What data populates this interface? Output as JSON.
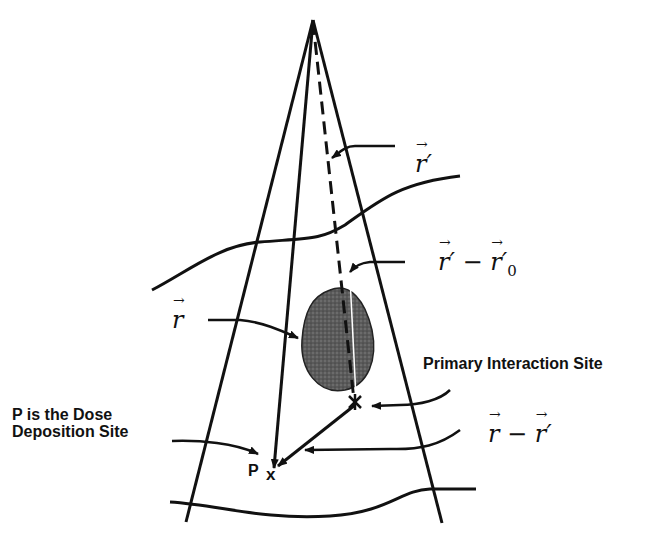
{
  "diagram": {
    "labels": {
      "r_prime": "r′",
      "r_prime_minus_r0_a": "r′",
      "minus": " − ",
      "r_prime_minus_r0_b": "r′",
      "r0_sub": "0",
      "r": "r",
      "r_minus_r_prime_a": "r",
      "r_minus_r_prime_b": "r′",
      "primary_interaction_site": "Primary Interaction Site",
      "dose_site_line1": "P is the Dose",
      "dose_site_line2": "Deposition Site",
      "point_p": "P",
      "point_p_marker": "x"
    },
    "colors": {
      "ink": "#111111",
      "tumor_fill": "#555555",
      "background": "#ffffff"
    }
  }
}
